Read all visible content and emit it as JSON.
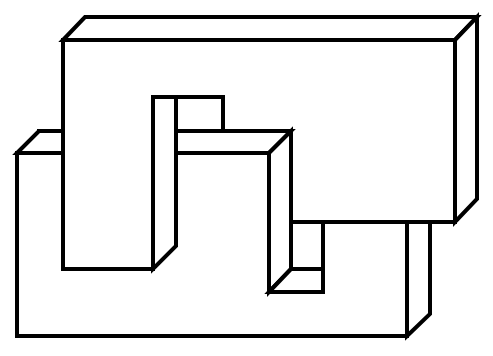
{
  "figure": {
    "description": "Impossible figure: two interlocking 3D rectangular blocks drawn as black line art on white",
    "background": "#ffffff",
    "stroke_color": "#000000",
    "stroke_width": 4
  },
  "shapes": {
    "back_slab": "lower-left L-shaped block",
    "top_slab": "upper-right block with hanging hooks",
    "pillar": "left downward column",
    "hook": "middle S-hook column"
  }
}
